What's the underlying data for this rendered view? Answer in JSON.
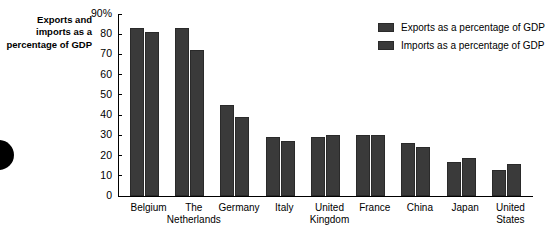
{
  "title_block": {
    "text": "Exports and imports as a percentage of GDP"
  },
  "decoration": {
    "edge_dot_name": "black-circle-marker"
  },
  "legend": {
    "position": "top-right",
    "entries": [
      {
        "label": "Exports as a percentage of GDP",
        "color": "#3a3a3a"
      },
      {
        "label": "Imports as a percentage of GDP",
        "color": "#3a3a3a"
      }
    ]
  },
  "axis": {
    "y_ticks": [
      "90%",
      "80",
      "70",
      "60",
      "50",
      "40",
      "30",
      "20",
      "10",
      "0"
    ]
  },
  "chart_data": {
    "type": "bar",
    "title": "Exports and imports as a percentage of GDP",
    "xlabel": "",
    "ylabel": "Exports and imports as a percentage of GDP",
    "ylim": [
      0,
      90
    ],
    "ytick_values": [
      0,
      10,
      20,
      30,
      40,
      50,
      60,
      70,
      80,
      90
    ],
    "ytick_labels": [
      "0",
      "10",
      "20",
      "30",
      "40",
      "50",
      "60",
      "70",
      "80",
      "90%"
    ],
    "grid": false,
    "legend_position": "top-right",
    "categories": [
      "Belgium",
      "The Netherlands",
      "Germany",
      "Italy",
      "United Kingdom",
      "France",
      "China",
      "Japan",
      "United States"
    ],
    "category_labels": [
      "Belgium",
      "The\nNetherlands",
      "Germany",
      "Italy",
      "United\nKingdom",
      "France",
      "China",
      "Japan",
      "United\nStates"
    ],
    "series": [
      {
        "name": "Exports as a percentage of GDP",
        "color": "#3a3a3a",
        "values": [
          83,
          83,
          45,
          29,
          29,
          30,
          26,
          17,
          13
        ]
      },
      {
        "name": "Imports as a percentage of GDP",
        "color": "#3a3a3a",
        "values": [
          81,
          72,
          39,
          27,
          30,
          30,
          24,
          19,
          16
        ]
      }
    ]
  }
}
